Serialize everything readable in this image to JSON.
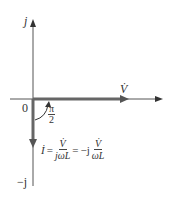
{
  "diagram": {
    "type": "phasor-diagram",
    "axes": {
      "positive_imag_label": "j",
      "negative_imag_label": "−j",
      "origin_label": "0"
    },
    "phasors": {
      "voltage": {
        "label": "V̇",
        "direction": "real-positive"
      },
      "current": {
        "label": "İ",
        "direction": "imag-negative"
      }
    },
    "angle": {
      "numerator": "π",
      "denominator": "2"
    },
    "equation": {
      "lhs": "İ",
      "eq1": "=",
      "frac1_num": "V̇",
      "frac1_den": "jωL",
      "eq2": "=",
      "neg_j": "−j",
      "frac2_num": "V̇",
      "frac2_den": "ωL"
    },
    "colors": {
      "axis": "#555555",
      "phasor": "#666666"
    }
  }
}
